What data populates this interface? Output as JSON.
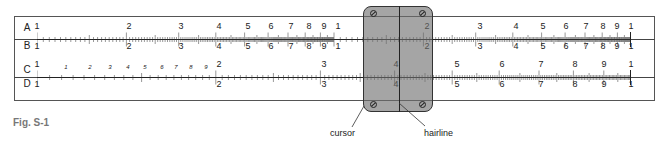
{
  "figure": {
    "caption": "Fig. S-1"
  },
  "scales": {
    "A": {
      "letter": "A",
      "labels": [
        {
          "t": "1",
          "x": 37
        },
        {
          "t": "2",
          "x": 129
        },
        {
          "t": "3",
          "x": 181
        },
        {
          "t": "4",
          "x": 219
        },
        {
          "t": "5",
          "x": 248
        },
        {
          "t": "6",
          "x": 271
        },
        {
          "t": "7",
          "x": 291
        },
        {
          "t": "8",
          "x": 309
        },
        {
          "t": "9",
          "x": 324
        },
        {
          "t": "1",
          "x": 338
        },
        {
          "t": "2",
          "x": 427
        },
        {
          "t": "3",
          "x": 480
        },
        {
          "t": "4",
          "x": 516
        },
        {
          "t": "5",
          "x": 543
        },
        {
          "t": "6",
          "x": 566
        },
        {
          "t": "7",
          "x": 586
        },
        {
          "t": "8",
          "x": 603
        },
        {
          "t": "9",
          "x": 617
        },
        {
          "t": "1",
          "x": 631
        }
      ]
    },
    "B": {
      "letter": "B",
      "labels": [
        {
          "t": "1",
          "x": 37
        },
        {
          "t": "2",
          "x": 129
        },
        {
          "t": "3",
          "x": 181
        },
        {
          "t": "4",
          "x": 219
        },
        {
          "t": "5",
          "x": 248
        },
        {
          "t": "6",
          "x": 271
        },
        {
          "t": "7",
          "x": 291
        },
        {
          "t": "8",
          "x": 309
        },
        {
          "t": "9",
          "x": 324
        },
        {
          "t": "1",
          "x": 338
        },
        {
          "t": "2",
          "x": 427
        },
        {
          "t": "3",
          "x": 480
        },
        {
          "t": "4",
          "x": 516
        },
        {
          "t": "5",
          "x": 543
        },
        {
          "t": "6",
          "x": 566
        },
        {
          "t": "7",
          "x": 586
        },
        {
          "t": "8",
          "x": 603
        },
        {
          "t": "9",
          "x": 617
        },
        {
          "t": "1",
          "x": 631
        }
      ]
    },
    "C": {
      "letter": "C",
      "labels": [
        {
          "t": "1",
          "x": 37
        },
        {
          "t": "1",
          "x": 66,
          "small": true
        },
        {
          "t": "2",
          "x": 90,
          "small": true
        },
        {
          "t": "3",
          "x": 110,
          "small": true
        },
        {
          "t": "4",
          "x": 128,
          "small": true
        },
        {
          "t": "5",
          "x": 145,
          "small": true
        },
        {
          "t": "6",
          "x": 162,
          "small": true
        },
        {
          "t": "7",
          "x": 176,
          "small": true
        },
        {
          "t": "8",
          "x": 191,
          "small": true
        },
        {
          "t": "9",
          "x": 206,
          "small": true
        },
        {
          "t": "2",
          "x": 219
        },
        {
          "t": "3",
          "x": 324
        },
        {
          "t": "4",
          "x": 396
        },
        {
          "t": "5",
          "x": 457
        },
        {
          "t": "6",
          "x": 502
        },
        {
          "t": "7",
          "x": 541
        },
        {
          "t": "8",
          "x": 575
        },
        {
          "t": "9",
          "x": 604
        },
        {
          "t": "1",
          "x": 631
        }
      ]
    },
    "D": {
      "letter": "D",
      "labels": [
        {
          "t": "1",
          "x": 37
        },
        {
          "t": "2",
          "x": 219
        },
        {
          "t": "3",
          "x": 324
        },
        {
          "t": "4",
          "x": 396
        },
        {
          "t": "5",
          "x": 457
        },
        {
          "t": "6",
          "x": 502
        },
        {
          "t": "7",
          "x": 541
        },
        {
          "t": "8",
          "x": 575
        },
        {
          "t": "9",
          "x": 604
        },
        {
          "t": "1",
          "x": 631
        }
      ]
    }
  },
  "callouts": {
    "cursor": "cursor",
    "hairline": "hairline"
  },
  "colors": {
    "cursor_fill": "#8a8a8a",
    "line": "#222222",
    "caption": "#777777"
  }
}
